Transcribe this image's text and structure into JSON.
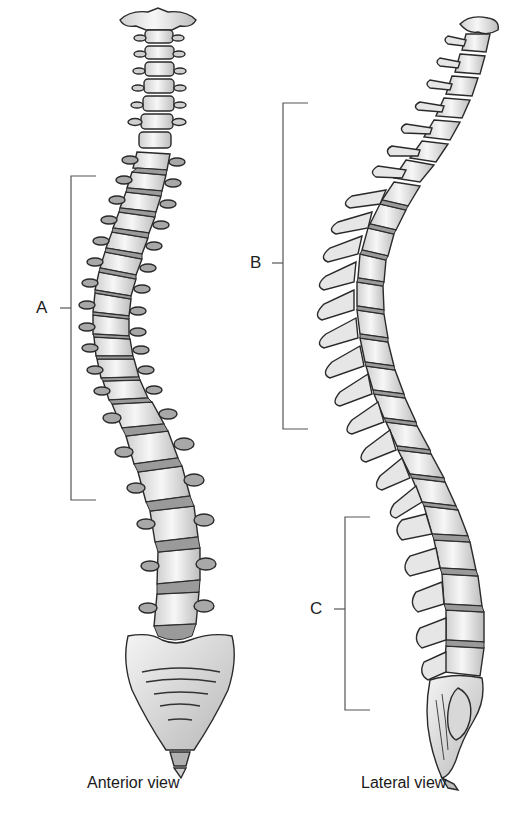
{
  "figure": {
    "colors": {
      "background": "#ffffff",
      "bone_fill": "#f0f0f0",
      "bone_shade": "#bdbdbd",
      "disc_fill": "#9a9a9a",
      "outline": "#2a2a2a",
      "bracket": "#555555"
    }
  },
  "views": [
    {
      "id": "anterior",
      "caption": "Anterior view",
      "brackets": [
        {
          "label": "A",
          "top": 176,
          "bottom": 500,
          "x": 71,
          "tick_y": 308
        }
      ]
    },
    {
      "id": "lateral",
      "caption": "Lateral view",
      "brackets": [
        {
          "label": "B",
          "top": 103,
          "bottom": 429,
          "x": 283,
          "tick_y": 263
        },
        {
          "label": "C",
          "top": 517,
          "bottom": 710,
          "x": 345,
          "tick_y": 609
        }
      ]
    }
  ]
}
